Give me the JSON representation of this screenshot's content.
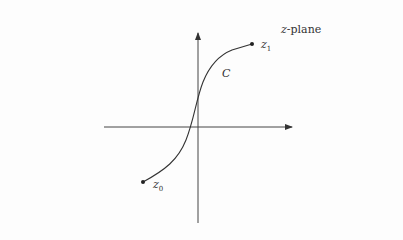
{
  "diagram": {
    "plane_label_var": "z",
    "plane_label_suffix": "-plane",
    "curve_label": "C",
    "start_point": {
      "name": "z",
      "sub": "0"
    },
    "end_point": {
      "name": "z",
      "sub": "1"
    },
    "colors": {
      "stroke": "#333333",
      "background": "#fdfdfd"
    }
  }
}
